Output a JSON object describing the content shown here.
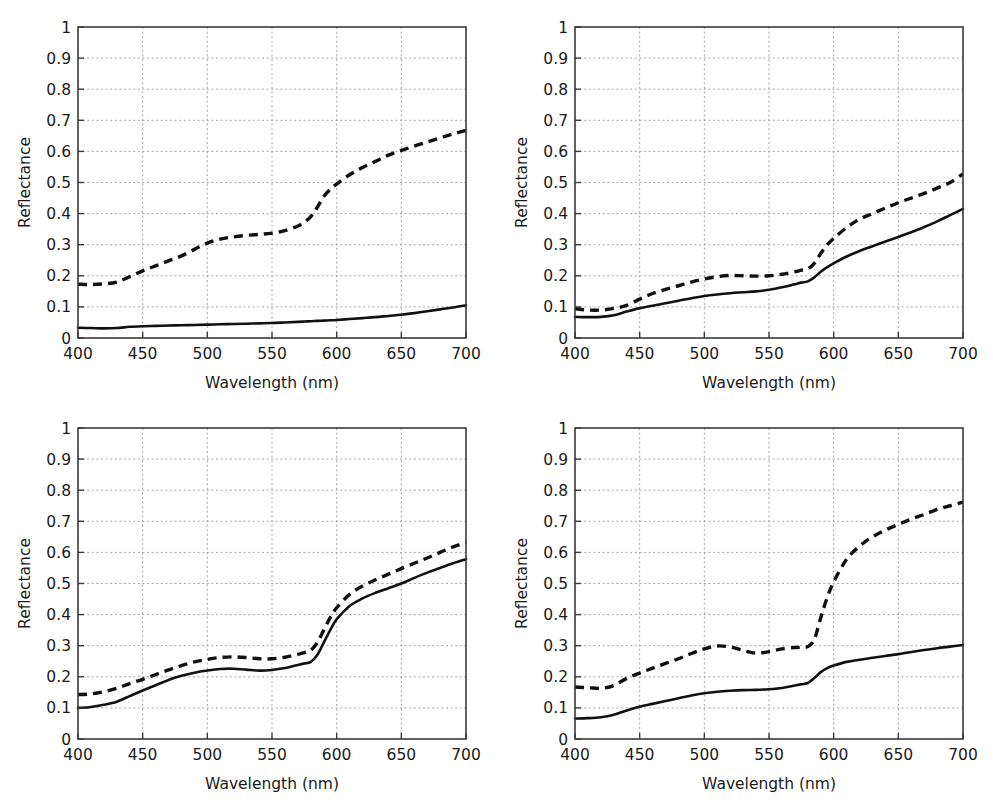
{
  "figure": {
    "background": "#ffffff",
    "ink_color": "#111111",
    "grid_color": "#9a9a9a",
    "axis_color": "#3a3a3a",
    "panel_count": 4,
    "layout": "2x2 grid"
  },
  "axes": {
    "xlabel": "Wavelength (nm)",
    "ylabel": "Reflectance",
    "xlim": [
      400,
      700
    ],
    "ylim": [
      0,
      1
    ],
    "xticks": [
      400,
      450,
      500,
      550,
      600,
      650,
      700
    ],
    "xticklabels": [
      "400",
      "450",
      "500",
      "550",
      "600",
      "650",
      "700"
    ],
    "yticks": [
      0,
      0.1,
      0.2,
      0.3,
      0.4,
      0.5,
      0.6,
      0.7,
      0.8,
      0.9,
      1
    ],
    "yticklabels": [
      "0",
      "0.1",
      "0.2",
      "0.3",
      "0.4",
      "0.5",
      "0.6",
      "0.7",
      "0.8",
      "0.9",
      "1"
    ],
    "grid": true,
    "legend": "none"
  },
  "chart_data": [
    {
      "type": "line",
      "panel": "top-left",
      "title": "",
      "xlabel": "Wavelength (nm)",
      "ylabel": "Reflectance",
      "xlim": [
        400,
        700
      ],
      "ylim": [
        0,
        1
      ],
      "grid": true,
      "x": [
        400,
        410,
        420,
        430,
        440,
        450,
        460,
        470,
        480,
        490,
        500,
        510,
        520,
        530,
        540,
        550,
        560,
        570,
        575,
        580,
        585,
        590,
        595,
        600,
        610,
        620,
        630,
        640,
        650,
        660,
        670,
        680,
        690,
        700
      ],
      "series": [
        {
          "name": "solid",
          "style": "solid",
          "values": [
            0.033,
            0.032,
            0.031,
            0.032,
            0.036,
            0.038,
            0.039,
            0.04,
            0.041,
            0.042,
            0.043,
            0.044,
            0.045,
            0.046,
            0.047,
            0.048,
            0.05,
            0.052,
            0.053,
            0.054,
            0.055,
            0.056,
            0.057,
            0.058,
            0.061,
            0.064,
            0.067,
            0.071,
            0.075,
            0.08,
            0.086,
            0.092,
            0.098,
            0.105
          ]
        },
        {
          "name": "dashed",
          "style": "dashed",
          "values": [
            0.173,
            0.172,
            0.174,
            0.18,
            0.197,
            0.216,
            0.232,
            0.248,
            0.264,
            0.285,
            0.305,
            0.318,
            0.325,
            0.33,
            0.333,
            0.337,
            0.345,
            0.36,
            0.372,
            0.39,
            0.42,
            0.455,
            0.478,
            0.495,
            0.525,
            0.548,
            0.568,
            0.588,
            0.603,
            0.617,
            0.63,
            0.643,
            0.656,
            0.668
          ]
        }
      ]
    },
    {
      "type": "line",
      "panel": "top-right",
      "title": "",
      "xlabel": "Wavelength (nm)",
      "ylabel": "Reflectance",
      "xlim": [
        400,
        700
      ],
      "ylim": [
        0,
        1
      ],
      "grid": true,
      "x": [
        400,
        410,
        420,
        430,
        440,
        450,
        460,
        470,
        480,
        490,
        500,
        510,
        520,
        530,
        540,
        550,
        560,
        570,
        575,
        580,
        585,
        590,
        595,
        600,
        610,
        620,
        630,
        640,
        650,
        660,
        670,
        680,
        690,
        700
      ],
      "series": [
        {
          "name": "solid",
          "style": "solid",
          "values": [
            0.068,
            0.067,
            0.068,
            0.073,
            0.085,
            0.096,
            0.104,
            0.112,
            0.12,
            0.128,
            0.135,
            0.14,
            0.144,
            0.147,
            0.15,
            0.155,
            0.163,
            0.173,
            0.178,
            0.182,
            0.195,
            0.213,
            0.228,
            0.24,
            0.262,
            0.28,
            0.295,
            0.31,
            0.325,
            0.34,
            0.357,
            0.375,
            0.395,
            0.415
          ]
        },
        {
          "name": "dashed",
          "style": "dashed",
          "values": [
            0.094,
            0.09,
            0.09,
            0.095,
            0.105,
            0.125,
            0.143,
            0.156,
            0.168,
            0.18,
            0.19,
            0.197,
            0.201,
            0.2,
            0.199,
            0.2,
            0.205,
            0.213,
            0.218,
            0.222,
            0.24,
            0.272,
            0.3,
            0.32,
            0.355,
            0.382,
            0.4,
            0.418,
            0.435,
            0.45,
            0.465,
            0.482,
            0.5,
            0.528
          ]
        }
      ]
    },
    {
      "type": "line",
      "panel": "bottom-left",
      "title": "",
      "xlabel": "Wavelength (nm)",
      "ylabel": "Reflectance",
      "xlim": [
        400,
        700
      ],
      "ylim": [
        0,
        1
      ],
      "grid": true,
      "x": [
        400,
        410,
        420,
        430,
        440,
        450,
        460,
        470,
        480,
        490,
        500,
        510,
        520,
        530,
        540,
        550,
        560,
        570,
        575,
        580,
        585,
        590,
        595,
        600,
        610,
        620,
        630,
        640,
        650,
        660,
        670,
        680,
        690,
        700
      ],
      "series": [
        {
          "name": "solid",
          "style": "solid",
          "values": [
            0.1,
            0.103,
            0.11,
            0.12,
            0.138,
            0.156,
            0.173,
            0.19,
            0.203,
            0.213,
            0.22,
            0.225,
            0.226,
            0.223,
            0.22,
            0.222,
            0.228,
            0.238,
            0.243,
            0.248,
            0.27,
            0.31,
            0.35,
            0.385,
            0.428,
            0.452,
            0.47,
            0.485,
            0.5,
            0.518,
            0.535,
            0.55,
            0.565,
            0.578
          ]
        },
        {
          "name": "dashed",
          "style": "dashed",
          "values": [
            0.143,
            0.145,
            0.152,
            0.163,
            0.178,
            0.192,
            0.207,
            0.222,
            0.236,
            0.248,
            0.256,
            0.262,
            0.264,
            0.262,
            0.258,
            0.258,
            0.263,
            0.272,
            0.278,
            0.285,
            0.31,
            0.35,
            0.39,
            0.422,
            0.465,
            0.492,
            0.512,
            0.53,
            0.548,
            0.565,
            0.582,
            0.6,
            0.618,
            0.632
          ]
        }
      ]
    },
    {
      "type": "line",
      "panel": "bottom-right",
      "title": "",
      "xlabel": "Wavelength (nm)",
      "ylabel": "Reflectance",
      "xlim": [
        400,
        700
      ],
      "ylim": [
        0,
        1
      ],
      "grid": true,
      "x": [
        400,
        410,
        420,
        430,
        440,
        450,
        460,
        470,
        480,
        490,
        500,
        510,
        520,
        530,
        540,
        550,
        560,
        570,
        575,
        580,
        585,
        590,
        595,
        600,
        610,
        620,
        630,
        640,
        650,
        660,
        670,
        680,
        690,
        700
      ],
      "series": [
        {
          "name": "solid",
          "style": "solid",
          "values": [
            0.066,
            0.067,
            0.07,
            0.078,
            0.092,
            0.104,
            0.113,
            0.122,
            0.131,
            0.14,
            0.147,
            0.152,
            0.155,
            0.157,
            0.158,
            0.16,
            0.164,
            0.172,
            0.176,
            0.18,
            0.196,
            0.215,
            0.228,
            0.236,
            0.248,
            0.255,
            0.261,
            0.267,
            0.273,
            0.28,
            0.286,
            0.292,
            0.297,
            0.302
          ]
        },
        {
          "name": "dashed",
          "style": "dashed",
          "values": [
            0.167,
            0.165,
            0.163,
            0.172,
            0.195,
            0.212,
            0.228,
            0.243,
            0.258,
            0.275,
            0.29,
            0.299,
            0.296,
            0.285,
            0.276,
            0.281,
            0.29,
            0.294,
            0.295,
            0.297,
            0.32,
            0.39,
            0.455,
            0.505,
            0.578,
            0.62,
            0.65,
            0.672,
            0.69,
            0.707,
            0.722,
            0.738,
            0.75,
            0.762
          ]
        }
      ]
    }
  ]
}
